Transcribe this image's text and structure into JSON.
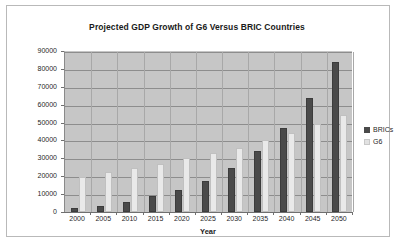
{
  "chart_data": {
    "type": "bar",
    "title": "Projected GDP Growth of G6 Versus BRIC Countries",
    "xlabel": "Year",
    "ylabel": "",
    "categories": [
      "2000",
      "2005",
      "2010",
      "2015",
      "2020",
      "2025",
      "2030",
      "2035",
      "2040",
      "2045",
      "2050"
    ],
    "series": [
      {
        "name": "BRICs",
        "color": "#4a4a4a",
        "values": [
          2500,
          3200,
          5500,
          8700,
          12500,
          17500,
          24800,
          34200,
          47000,
          63500,
          84000
        ]
      },
      {
        "name": "G6",
        "color": "#e9e9e9",
        "values": [
          19500,
          22200,
          24700,
          26800,
          30000,
          32900,
          36000,
          40100,
          44000,
          49000,
          54500
        ]
      }
    ],
    "ylim": [
      0,
      90000
    ],
    "ytick_values": [
      0,
      10000,
      20000,
      30000,
      40000,
      50000,
      60000,
      70000,
      80000,
      90000
    ],
    "ytick_labels": [
      "0",
      "10000",
      "20000",
      "30000",
      "40000",
      "50000",
      "60000",
      "70000",
      "80000",
      "90000"
    ],
    "grid": true,
    "legend_position": "right",
    "plot_background": "#c6c6c6",
    "page_background": "#ffffff"
  },
  "legend": {
    "entries": [
      {
        "label": "BRICs"
      },
      {
        "label": "G6"
      }
    ]
  }
}
